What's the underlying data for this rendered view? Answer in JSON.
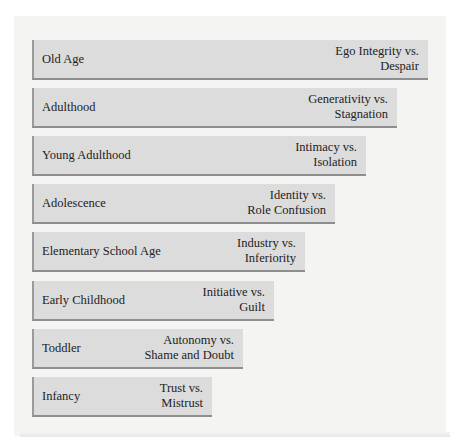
{
  "diagram": {
    "type": "staircase-bar-diagram",
    "stages": [
      {
        "stage": "Old Age",
        "crisis_line1": "Ego Integrity vs.",
        "crisis_line2": "Despair",
        "top": 40,
        "width": 396
      },
      {
        "stage": "Adulthood",
        "crisis_line1": "Generativity vs.",
        "crisis_line2": "Stagnation",
        "top": 88,
        "width": 365
      },
      {
        "stage": "Young Adulthood",
        "crisis_line1": "Intimacy vs.",
        "crisis_line2": "Isolation",
        "top": 136,
        "width": 334
      },
      {
        "stage": "Adolescence",
        "crisis_line1": "Identity vs.",
        "crisis_line2": "Role Confusion",
        "top": 184,
        "width": 303
      },
      {
        "stage": "Elementary School Age",
        "crisis_line1": "Industry vs.",
        "crisis_line2": "Inferiority",
        "top": 232,
        "width": 273
      },
      {
        "stage": "Early Childhood",
        "crisis_line1": "Initiative vs.",
        "crisis_line2": "Guilt",
        "top": 281,
        "width": 242
      },
      {
        "stage": "Toddler",
        "crisis_line1": "Autonomy vs.",
        "crisis_line2": "Shame and Doubt",
        "top": 329,
        "width": 211
      },
      {
        "stage": "Infancy",
        "crisis_line1": "Trust vs.",
        "crisis_line2": "Mistrust",
        "top": 377,
        "width": 180
      }
    ]
  },
  "colors": {
    "bar_fill": "#dcdcdc",
    "bar_edge": "#8e8e8e",
    "panel": "#f4f4f3",
    "text": "#222222"
  }
}
